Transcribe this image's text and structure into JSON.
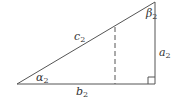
{
  "diagram": {
    "type": "right-triangle",
    "vertices": {
      "left": [
        17,
        84
      ],
      "right_angle": [
        155,
        84
      ],
      "top": [
        155,
        2
      ]
    },
    "dashed_line": {
      "x": 115,
      "y1": 27,
      "y2": 84
    },
    "stroke_color": "#555555",
    "labels": {
      "hypotenuse": {
        "base": "c",
        "sub": "2"
      },
      "vertical_side": {
        "base": "a",
        "sub": "2"
      },
      "base_side": {
        "base": "b",
        "sub": "2"
      },
      "angle_left": {
        "base": "α",
        "sub": "2"
      },
      "angle_top": {
        "base": "β",
        "sub": "2"
      }
    }
  }
}
